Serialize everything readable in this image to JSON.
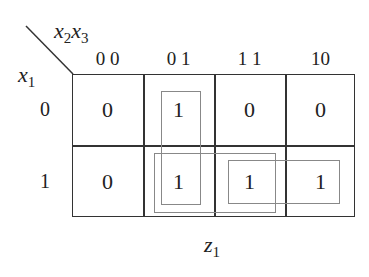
{
  "kmap": {
    "col_vars_label": "x2x3",
    "row_var_label": "x1",
    "col_headers": [
      "0 0",
      "0 1",
      "1 1",
      "10"
    ],
    "row_headers": [
      "0",
      "1"
    ],
    "cells": [
      [
        "0",
        "1",
        "0",
        "0"
      ],
      [
        "0",
        "1",
        "1",
        "1"
      ]
    ],
    "output_label": "z1",
    "loops": [
      {
        "cells": "x1'x2'x3 + x1x2'x3 column 01",
        "color": "#888888"
      },
      {
        "cells": "row1 cols 01-11",
        "color": "#888888"
      },
      {
        "cells": "row1 cols 11-10",
        "color": "#888888"
      }
    ]
  }
}
